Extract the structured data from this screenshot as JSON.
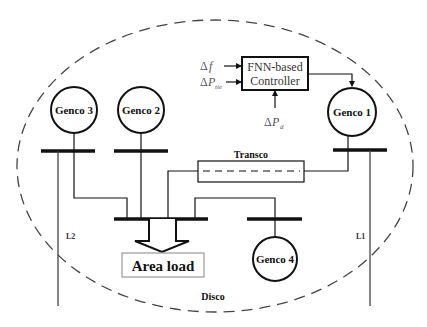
{
  "diagram": {
    "type": "power-system-control-area",
    "region_label": "Disco",
    "controller": {
      "label_line1": "FNN-based",
      "label_line2": "Controller",
      "inputs": [
        {
          "symbol": "Δ",
          "var": "f",
          "sub": ""
        },
        {
          "symbol": "Δ",
          "var": "P",
          "sub": "tie"
        }
      ],
      "disturbance": {
        "symbol": "Δ",
        "var": "P",
        "sub": "d"
      }
    },
    "generators": [
      {
        "id": "genco1",
        "label": "Genco 1"
      },
      {
        "id": "genco2",
        "label": "Genco 2"
      },
      {
        "id": "genco3",
        "label": "Genco 3"
      },
      {
        "id": "genco4",
        "label": "Genco 4"
      }
    ],
    "transmission": {
      "label": "Transco"
    },
    "load": {
      "label": "Area load"
    },
    "tie_lines": [
      {
        "id": "l1",
        "label": "L1"
      },
      {
        "id": "l2",
        "label": "L2"
      }
    ],
    "colors": {
      "line": "#111111",
      "dashed_boundary": "#444444",
      "text": "#111111",
      "light_text": "#555555",
      "load_box_border": "#888888"
    }
  }
}
